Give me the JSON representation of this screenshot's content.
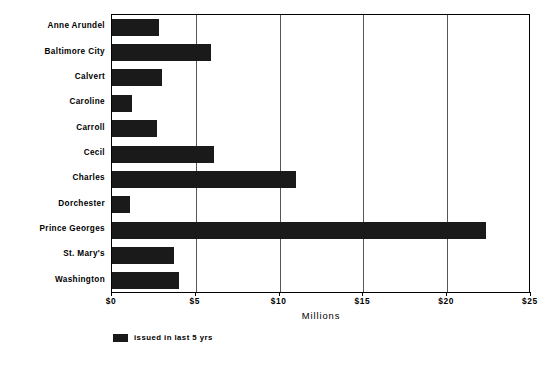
{
  "chart_data": {
    "type": "bar",
    "orientation": "horizontal",
    "title": "",
    "subtitle": "",
    "xlabel": "Millions",
    "ylabel": "",
    "xlim": [
      0,
      25
    ],
    "xticks": [
      0,
      5,
      10,
      15,
      20,
      25
    ],
    "xtick_labels": [
      "$0",
      "$5",
      "$10",
      "$15",
      "$20",
      "$25"
    ],
    "grid": true,
    "grid_axis": "x",
    "legend_position": "below-left",
    "bar_color": "#1a1a1a",
    "categories": [
      "Anne Arundel",
      "Baltimore City",
      "Calvert",
      "Caroline",
      "Carroll",
      "Cecil",
      "Charles",
      "Dorchester",
      "Prince Georges",
      "St. Mary's",
      "Washington"
    ],
    "series": [
      {
        "name": "issued in last 5 yrs",
        "values": [
          2.8,
          5.9,
          3.0,
          1.2,
          2.7,
          6.1,
          11.0,
          1.1,
          22.3,
          3.7,
          4.0
        ]
      }
    ]
  },
  "legend": {
    "entries": [
      {
        "label": "issued in last 5 yrs",
        "color": "#1a1a1a"
      }
    ]
  }
}
